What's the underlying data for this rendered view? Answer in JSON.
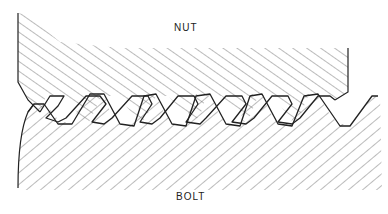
{
  "diagram": {
    "type": "cross-section",
    "labels": {
      "nut": "NUT",
      "bolt": "BOLT"
    },
    "parts": [
      {
        "name": "nut",
        "hatch": "diagonal-down-right",
        "position": "top"
      },
      {
        "name": "bolt",
        "hatch": "diagonal-up-right",
        "position": "bottom"
      }
    ],
    "thread_count_visible": 6,
    "colors": {
      "line": "#222222",
      "hatch": "#555555",
      "background": "#ffffff"
    }
  }
}
